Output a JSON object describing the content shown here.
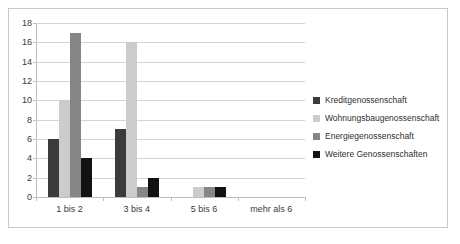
{
  "chart_data": {
    "type": "bar",
    "title": "",
    "subtitle": "",
    "xlabel": "",
    "ylabel": "",
    "ylim": [
      0,
      18
    ],
    "ytick_step": 2,
    "yticks": [
      "18",
      "16",
      "14",
      "12",
      "10",
      "8",
      "6",
      "4",
      "2",
      "0"
    ],
    "grid": true,
    "legend_position": "right",
    "categories": [
      "1 bis 2",
      "3 bis 4",
      "5 bis 6",
      "mehr als 6"
    ],
    "series": [
      {
        "name": "Kreditgenossenschaft",
        "color": "#3b3b3b",
        "values": [
          6,
          7,
          0,
          0
        ]
      },
      {
        "name": "Wohnungsbaugenossenschaft",
        "color": "#cccccc",
        "values": [
          10,
          16,
          1,
          0
        ]
      },
      {
        "name": "Energiegenossenschaft",
        "color": "#868686",
        "values": [
          17,
          1,
          1,
          0
        ]
      },
      {
        "name": "Weitere Genossenschaften",
        "color": "#121212",
        "values": [
          4,
          2,
          1,
          0
        ]
      }
    ]
  }
}
